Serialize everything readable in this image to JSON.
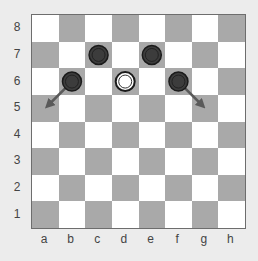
{
  "diagram": {
    "colors": {
      "background": "#ececec",
      "light_square": "#ffffff",
      "dark_square": "#a9a9a9",
      "border": "#6d6d6d",
      "black_piece": "#3c3c3c",
      "black_piece_ring": "#1a1a1a",
      "white_piece": "#ffffff",
      "white_piece_ring": "#1a1a1a",
      "arrow": "#5a5a5a",
      "label": "#444444"
    },
    "files": [
      "a",
      "b",
      "c",
      "d",
      "e",
      "f",
      "g",
      "h"
    ],
    "ranks": [
      "8",
      "7",
      "6",
      "5",
      "4",
      "3",
      "2",
      "1"
    ],
    "pieces": [
      {
        "square": "c7",
        "color": "black"
      },
      {
        "square": "e7",
        "color": "black"
      },
      {
        "square": "b6",
        "color": "black"
      },
      {
        "square": "f6",
        "color": "black"
      },
      {
        "square": "d6",
        "color": "white"
      }
    ],
    "arrows": [
      {
        "from": "b6",
        "to": "a5"
      },
      {
        "from": "f6",
        "to": "g5"
      }
    ]
  }
}
